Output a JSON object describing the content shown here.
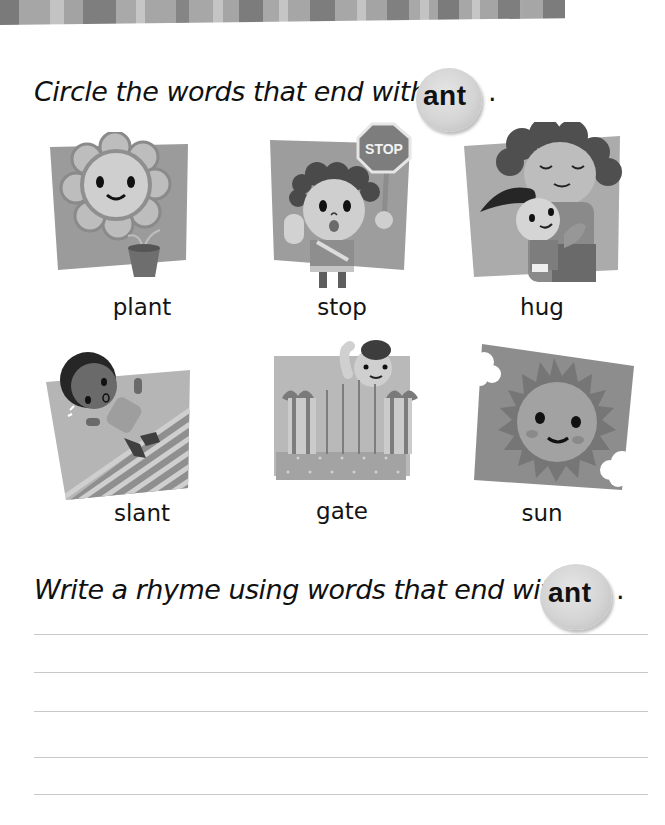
{
  "header_stripes": [
    {
      "w": 19,
      "c": "#7a7a7a"
    },
    {
      "w": 31,
      "c": "#a6a6a6"
    },
    {
      "w": 14,
      "c": "#c3c3c3"
    },
    {
      "w": 19,
      "c": "#a3a3a3"
    },
    {
      "w": 33,
      "c": "#7e7e7e"
    },
    {
      "w": 20,
      "c": "#a9a9a9"
    },
    {
      "w": 9,
      "c": "#c6c6c6"
    },
    {
      "w": 31,
      "c": "#a6a6a6"
    },
    {
      "w": 13,
      "c": "#858585"
    },
    {
      "w": 24,
      "c": "#a7a7a7"
    },
    {
      "w": 10,
      "c": "#c4c4c4"
    },
    {
      "w": 16,
      "c": "#a5a5a5"
    },
    {
      "w": 24,
      "c": "#7c7c7c"
    },
    {
      "w": 16,
      "c": "#a8a8a8"
    },
    {
      "w": 9,
      "c": "#c5c5c5"
    },
    {
      "w": 22,
      "c": "#a6a6a6"
    },
    {
      "w": 25,
      "c": "#7d7d7d"
    },
    {
      "w": 22,
      "c": "#a7a7a7"
    },
    {
      "w": 9,
      "c": "#c4c4c4"
    },
    {
      "w": 21,
      "c": "#a4a4a4"
    },
    {
      "w": 22,
      "c": "#808080"
    },
    {
      "w": 11,
      "c": "#a8a8a8"
    },
    {
      "w": 9,
      "c": "#c3c3c3"
    },
    {
      "w": 9,
      "c": "#a6a6a6"
    },
    {
      "w": 21,
      "c": "#7b7b7b"
    },
    {
      "w": 13,
      "c": "#a7a7a7"
    },
    {
      "w": 8,
      "c": "#c6c6c6"
    },
    {
      "w": 18,
      "c": "#a5a5a5"
    },
    {
      "w": 22,
      "c": "#7e7e7e"
    },
    {
      "w": 3,
      "c": "#a8a8a8"
    },
    {
      "w": 20,
      "c": "#a6a6a6"
    },
    {
      "w": 22,
      "c": "#7c7c7c"
    }
  ],
  "section1": {
    "instruction": "Circle the words that end with",
    "target": "ant",
    "period": "."
  },
  "pictures": [
    {
      "id": "plant",
      "word": "plant"
    },
    {
      "id": "stop",
      "word": "stop",
      "sign_text": "STOP"
    },
    {
      "id": "hug",
      "word": "hug"
    },
    {
      "id": "slant",
      "word": "slant"
    },
    {
      "id": "gate",
      "word": "gate"
    },
    {
      "id": "sun",
      "word": "sun"
    }
  ],
  "section2": {
    "instruction": "Write a rhyme using  words that end with",
    "target": "ant",
    "period": "."
  },
  "writing_lines": 5
}
